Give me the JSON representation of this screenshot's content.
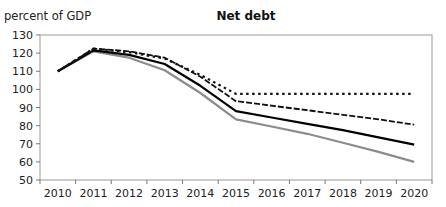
{
  "chart_data": {
    "type": "line",
    "title": "Net debt",
    "ylabel": "percent of GDP",
    "xlabel": "",
    "ylim": [
      50,
      130
    ],
    "yticks": [
      50,
      60,
      70,
      80,
      90,
      100,
      110,
      120,
      130
    ],
    "categories": [
      "2010",
      "2011",
      "2012",
      "2013",
      "2014",
      "2015",
      "2016",
      "2017",
      "2018",
      "2019",
      "2020"
    ],
    "grid": false,
    "legend": "none",
    "series": [
      {
        "name": "dotted",
        "style": "dotted",
        "color": "#111111",
        "values": [
          110,
          122.5,
          120.5,
          117,
          108,
          97.5,
          97.5,
          97.5,
          97.5,
          97.5,
          97.5
        ]
      },
      {
        "name": "dashed",
        "style": "dashed",
        "color": "#111111",
        "values": [
          110,
          122.5,
          121,
          117.5,
          107,
          93.5,
          91,
          88.5,
          86,
          83.5,
          80.5
        ]
      },
      {
        "name": "solid-black",
        "style": "solid",
        "color": "#000000",
        "values": [
          110,
          121.5,
          119,
          114,
          102,
          88,
          84.5,
          81,
          77.5,
          73.5,
          69.5
        ]
      },
      {
        "name": "solid-gray",
        "style": "solid",
        "color": "#8c8c8c",
        "values": [
          110,
          121,
          117.5,
          110.5,
          98,
          83.5,
          79.5,
          75.5,
          70.5,
          65.5,
          60
        ]
      }
    ]
  }
}
